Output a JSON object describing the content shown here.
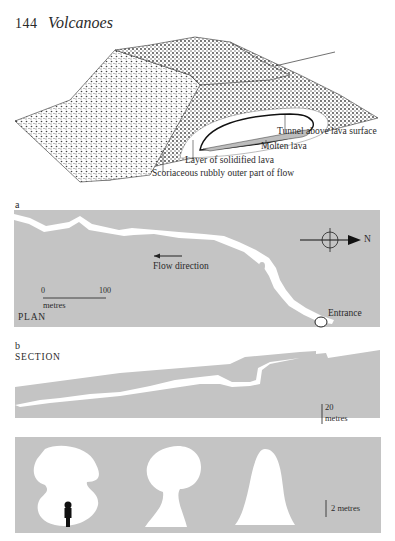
{
  "header": {
    "page_number": "144",
    "running_title": "Volcanoes"
  },
  "block_diagram": {
    "labels": {
      "tunnel": "Tunnel above lava surface",
      "molten": "Molten lava",
      "solidified": "Layer of solidified lava",
      "scoriaceous": "Scoriaceous rubbly outer part of flow"
    }
  },
  "plan_panel": {
    "letter": "a",
    "title": "PLAN",
    "flow_direction_label": "Flow direction",
    "entrance_label": "Entrance",
    "north_label": "N",
    "scale": {
      "start": "0",
      "end": "100",
      "unit": "metres"
    }
  },
  "section_panel": {
    "letter": "b",
    "title": "SECTION",
    "scale": {
      "value": "20",
      "unit": "metres"
    }
  },
  "cross_sections_panel": {
    "scale_label": "2 metres",
    "shapes": [
      "bilobed-chamber-with-figure",
      "mushroom-shaped",
      "conical-arch"
    ]
  },
  "colors": {
    "panel_gray": "#c4c4c4",
    "ink": "#2a2a2a",
    "paper": "#ffffff",
    "cavity": "#ffffff"
  }
}
